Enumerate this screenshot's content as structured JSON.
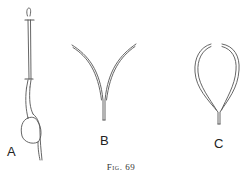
{
  "figure": {
    "caption": "Fig. 69",
    "panels": [
      {
        "id": "A",
        "label": "A",
        "description": "seedling stem with bulbous base"
      },
      {
        "id": "B",
        "label": "B",
        "description": "V-shaped forked structure"
      },
      {
        "id": "C",
        "label": "C",
        "description": "loop-shaped structure with open top"
      }
    ],
    "colors": {
      "ink": "#555555",
      "background": "#ffffff"
    }
  }
}
